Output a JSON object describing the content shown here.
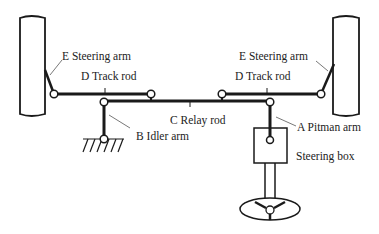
{
  "diagram": {
    "colors": {
      "line": "#1a1a1a",
      "leader": "#555555",
      "background": "#ffffff"
    },
    "labels": {
      "steering_arm_left": "E  Steering arm",
      "steering_arm_right": "E  Steering arm",
      "track_rod_left": "D  Track rod",
      "track_rod_right": "D  Track rod",
      "relay_rod": "C  Relay rod",
      "idler_arm": "B  Idler arm",
      "pitman_arm": "A  Pitman arm",
      "steering_box": "Steering box"
    },
    "components": [
      "left-wheel",
      "right-wheel",
      "steering-arm-left",
      "steering-arm-right",
      "track-rod-left",
      "track-rod-right",
      "relay-rod",
      "idler-arm",
      "pitman-arm",
      "steering-box",
      "steering-column",
      "steering-wheel",
      "ground-anchor"
    ]
  }
}
